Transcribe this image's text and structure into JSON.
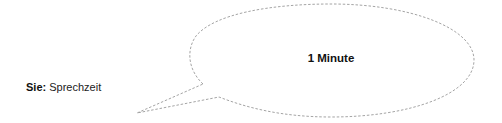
{
  "speaker": {
    "name": "Sie:",
    "role": "Sprechzeit"
  },
  "bubble": {
    "text": "1 Minute",
    "shape": "speech-bubble-ellipse",
    "border_style": "dashed",
    "border_color": "#9a9a9a",
    "fill_color": "#ffffff"
  },
  "colors": {
    "background": "#ffffff",
    "text": "#111111",
    "outline": "#9a9a9a"
  }
}
